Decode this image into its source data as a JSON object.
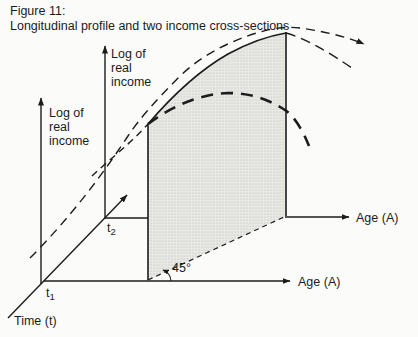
{
  "title": {
    "line1": "Figure 11:",
    "line2": "Longitudinal profile and two income cross-sections"
  },
  "axes": {
    "log_income_line1": "Log of",
    "log_income_line2": "real",
    "log_income_line3": "income",
    "age_upper": "Age (A)",
    "age_lower": "Age (A)",
    "time": "Time (t)",
    "t1_base": "t",
    "t1_sub": "1",
    "t2_base": "t",
    "t2_sub": "2"
  },
  "annotations": {
    "angle": "45°"
  },
  "curves": {
    "longitudinal_profile": "thin long-dash curve with arrowheads",
    "cohort_profile_segment": "solid curve along top of shaded band, dashed beyond the cross-section planes",
    "t2_cross_section": "heavy dashed curve peaking inside shaded band",
    "projection_45_line": "dashed 45-degree projection line between age axes"
  },
  "colors": {
    "ink": "#1c1c1c",
    "shade_fill": "#e8e8e5",
    "shade_dot": "#b9b9b4",
    "background": "#fbfbf9"
  }
}
